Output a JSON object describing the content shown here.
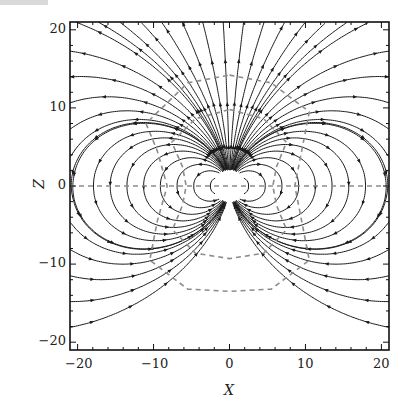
{
  "chart_data": {
    "type": "streamplot",
    "title": "",
    "xlabel": "X",
    "ylabel": "Z",
    "xlim": [
      -21,
      21
    ],
    "ylim": [
      -21,
      21
    ],
    "xticks": [
      -20,
      -10,
      0,
      10,
      20
    ],
    "yticks": [
      -20,
      -10,
      0,
      10,
      20
    ],
    "x_tick_labels": [
      "−20",
      "−10",
      "0",
      "10",
      "20"
    ],
    "y_tick_labels": [
      "−20",
      "−10",
      "0",
      "10",
      "20"
    ],
    "minor_tick_step": 2,
    "field": {
      "description": "Dipole-like vector field; moment along +Z; lines exit upward, loop around both sides, downward at Z=0, return from below",
      "moment": [
        0,
        1
      ]
    },
    "reference_curves": [
      {
        "name": "z-axis-dashed",
        "type": "line",
        "points": [
          [
            -21,
            0
          ],
          [
            21,
            0
          ]
        ],
        "style": "dashed",
        "color": "#8c8c8c"
      },
      {
        "name": "outer-dashed-curve",
        "type": "closed",
        "approx_points": [
          [
            0,
            14.2
          ],
          [
            5.5,
            13.2
          ],
          [
            10.5,
            9.5
          ],
          [
            9.5,
            4.5
          ],
          [
            8.6,
            0
          ],
          [
            9.5,
            -4.5
          ],
          [
            10.5,
            -9.5
          ],
          [
            5.5,
            -13.2
          ],
          [
            0,
            -13.5
          ],
          [
            -5.5,
            -13.2
          ],
          [
            -10.5,
            -9.5
          ],
          [
            -9.5,
            -4.5
          ],
          [
            -8.2,
            0
          ],
          [
            -9.5,
            4.5
          ],
          [
            -11,
            8
          ],
          [
            -5.5,
            13.2
          ]
        ],
        "style": "dashed",
        "color": "#8c8c8c"
      },
      {
        "name": "inner-dashed-curve",
        "type": "closed",
        "approx_points": [
          [
            0,
            9.8
          ],
          [
            4.5,
            8.6
          ],
          [
            7.5,
            5.6
          ],
          [
            6.2,
            2.5
          ],
          [
            5.7,
            0
          ],
          [
            6.2,
            -2.5
          ],
          [
            7.5,
            -5.6
          ],
          [
            4.5,
            -8.6
          ],
          [
            0,
            -9.3
          ],
          [
            -4.5,
            -8.6
          ],
          [
            -7.5,
            -5.6
          ],
          [
            -6.2,
            -2.5
          ],
          [
            -5.7,
            0
          ],
          [
            -6.2,
            2.5
          ],
          [
            -7.6,
            5.6
          ],
          [
            -4.5,
            8.6
          ]
        ],
        "style": "dashed",
        "color": "#8c8c8c"
      }
    ],
    "grid": false,
    "legend": null
  },
  "style": {
    "line_color": "#1a1a1a",
    "dashed_color": "#8c8c8c",
    "frame_color": "#111111"
  }
}
